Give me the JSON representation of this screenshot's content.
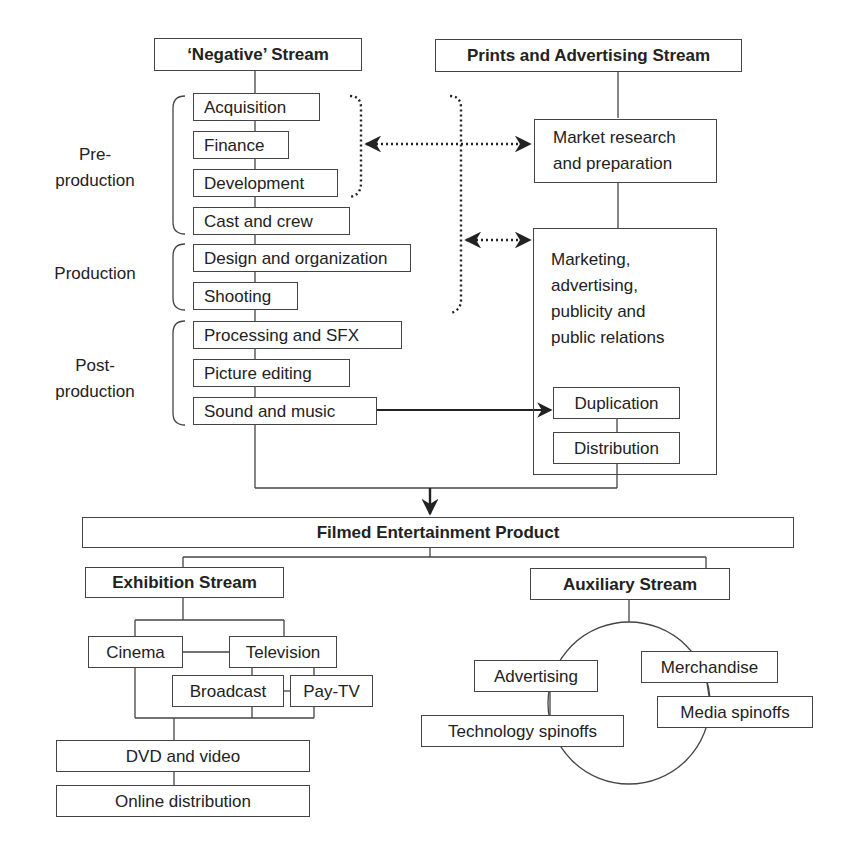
{
  "streams": {
    "negative": "‘Negative’ Stream",
    "prints_advertising": "Prints and Advertising Stream"
  },
  "phases": {
    "preproduction": "Pre-\nproduction",
    "production": "Production",
    "postproduction": "Post-\nproduction"
  },
  "negative_steps": [
    "Acquisition",
    "Finance",
    "Development",
    "Cast and crew",
    "Design and organization",
    "Shooting",
    "Processing and SFX",
    "Picture editing",
    "Sound and music"
  ],
  "pa_steps": {
    "market_research": "Market research\nand preparation",
    "marketing": "Marketing,\nadvertising,\npublicity and\npublic relations",
    "duplication": "Duplication",
    "distribution": "Distribution"
  },
  "product": "Filmed Entertainment Product",
  "exhibition": {
    "title": "Exhibition Stream",
    "cinema": "Cinema",
    "television": "Television",
    "broadcast": "Broadcast",
    "paytv": "Pay-TV",
    "dvd": "DVD and video",
    "online": "Online distribution"
  },
  "auxiliary": {
    "title": "Auxiliary Stream",
    "advertising": "Advertising",
    "technology": "Technology spinoffs",
    "merchandise": "Merchandise",
    "media": "Media spinoffs"
  },
  "colors": {
    "line": "#444444",
    "text": "#222222",
    "background": "#ffffff"
  }
}
